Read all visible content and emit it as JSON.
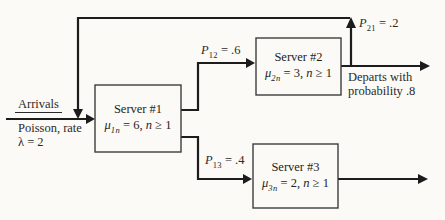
{
  "palette": {
    "paper": "#fbfaf6",
    "line": "#1c1c1c",
    "box_border": "#3d3d3d"
  },
  "arrival": {
    "label": "Arrivals",
    "sub_label_1": "Poisson, rate",
    "sub_label_2": "λ = 2"
  },
  "servers": [
    {
      "name": "Server #1",
      "mu_sym": "μ",
      "mu_sub": "1n",
      "mu_eq": " = 6, ",
      "n_sym": "n",
      "n_cond": " ≥ 1"
    },
    {
      "name": "Server #2",
      "mu_sym": "μ",
      "mu_sub": "2n",
      "mu_eq": " = 3, ",
      "n_sym": "n",
      "n_cond": " ≥ 1"
    },
    {
      "name": "Server #3",
      "mu_sym": "μ",
      "mu_sub": "3n",
      "mu_eq": " = 2, ",
      "n_sym": "n",
      "n_cond": " ≥ 1"
    }
  ],
  "routing": [
    {
      "sym": "P",
      "sub": "12",
      "eq": " = .6"
    },
    {
      "sym": "P",
      "sub": "13",
      "eq": " = .4"
    },
    {
      "sym": "P",
      "sub": "21",
      "eq": " = .2"
    }
  ],
  "departure": {
    "line1": "Departs with",
    "line2": "probability .8"
  }
}
